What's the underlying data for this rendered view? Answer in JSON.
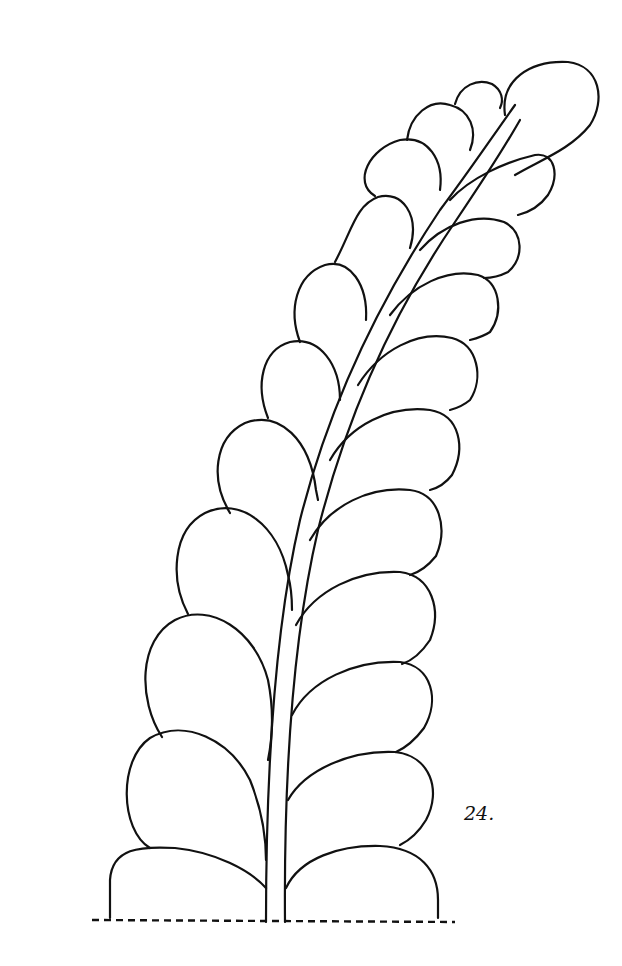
{
  "figure": {
    "label": "24.",
    "ink_color": "#111111",
    "background_color": "#ffffff"
  }
}
